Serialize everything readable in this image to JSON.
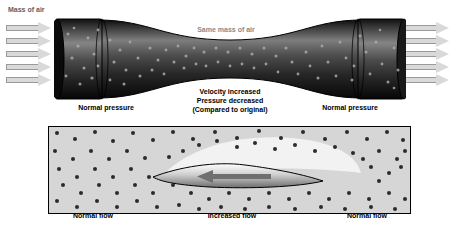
{
  "figure": {
    "top_panel": {
      "label_inlet": "Mass of air",
      "label_throat_flow": "Same mass of air",
      "label_left_pressure": "Normal pressure",
      "label_right_pressure": "Normal pressure",
      "label_center_line1": "Velocity increased",
      "label_center_line2": "Pressure decreased",
      "label_center_line3": "(Compared to original)",
      "arrow_count_left": 5,
      "arrow_count_right": 5,
      "arrow_direction": "right"
    },
    "bottom_panel": {
      "label_left": "Normal flow",
      "label_center": "Increased flow",
      "label_right": "Normal flow",
      "flow_arrow_direction": "left"
    },
    "colors": {
      "background": "#ffffff",
      "panel_fill": "#d6d6d6",
      "particle": "#2b2b2b",
      "tube_dark": "#1b1b1b",
      "arrow_fill": "#d9d9d9",
      "arrow_stroke": "#9a9a9a",
      "flow_arrow": "#6f6f6f",
      "text": "#000000",
      "throat_text": "#8a8a8a"
    }
  }
}
